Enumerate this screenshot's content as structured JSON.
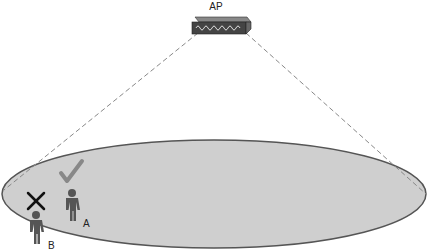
{
  "diagram": {
    "access_point": {
      "label": "AP",
      "icon": "access-point-icon"
    },
    "coverage_area": {
      "fill": "#cfcfcf",
      "stroke": "#555555"
    },
    "clients": [
      {
        "label": "A",
        "status": "connected",
        "status_icon": "checkmark-icon",
        "status_color": "#888888",
        "body_color": "#555555"
      },
      {
        "label": "B",
        "status": "not-connected",
        "status_icon": "x-mark-icon",
        "status_color": "#111111",
        "body_color": "#555555"
      }
    ]
  }
}
